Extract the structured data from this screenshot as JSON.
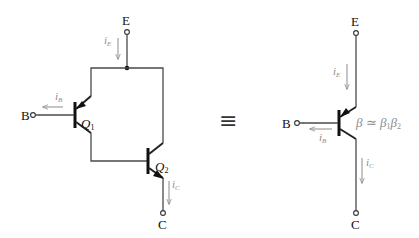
{
  "diagram": {
    "type": "darlington-pair-equivalence",
    "left_circuit": {
      "terminals": {
        "emitter": "E",
        "base": "B",
        "collector": "C"
      },
      "transistors": [
        {
          "name": "Q",
          "sub": "1"
        },
        {
          "name": "Q",
          "sub": "2"
        }
      ],
      "currents": {
        "emitter": {
          "symbol": "i",
          "sub": "E"
        },
        "base": {
          "symbol": "i",
          "sub": "B"
        },
        "collector": {
          "symbol": "i",
          "sub": "C"
        }
      }
    },
    "equivalence_symbol": "≡",
    "right_circuit": {
      "terminals": {
        "emitter": "E",
        "base": "B",
        "collector": "C"
      },
      "currents": {
        "emitter": {
          "symbol": "i",
          "sub": "E"
        },
        "base": {
          "symbol": "i",
          "sub": "B"
        },
        "collector": {
          "symbol": "i",
          "sub": "C"
        }
      },
      "beta_relation": {
        "lhs": "β",
        "op": " ≃ ",
        "b1": "β",
        "b1_sub": "1",
        "b2": "β",
        "b2_sub": "2"
      }
    },
    "colors": {
      "wire": "#4a4a4a",
      "current_arrow": "#8c8c8c",
      "text": "#111111"
    }
  }
}
